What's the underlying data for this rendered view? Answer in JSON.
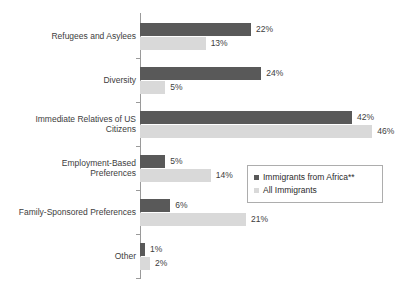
{
  "chart_data": {
    "type": "bar",
    "orientation": "horizontal",
    "title": "",
    "xlabel": "",
    "ylabel": "",
    "xlim": [
      0,
      50
    ],
    "grid": false,
    "legend_position": "middle-right",
    "value_suffix": "%",
    "categories": [
      "Refugees and Asylees",
      "Diversity",
      "Immediate Relatives of US Citizens",
      "Employment-Based Preferences",
      "Family-Sponsored Preferences",
      "Other"
    ],
    "series": [
      {
        "name": "Immigrants from Africa**",
        "color": "#595959",
        "values": [
          22,
          24,
          42,
          5,
          6,
          1
        ],
        "labels": [
          "22%",
          "24%",
          "42%",
          "5%",
          "6%",
          "1%"
        ]
      },
      {
        "name": "All Immigrants",
        "color": "#d9d9d9",
        "values": [
          13,
          5,
          46,
          14,
          21,
          2
        ],
        "labels": [
          "13%",
          "5%",
          "46%",
          "14%",
          "21%",
          "2%"
        ]
      }
    ]
  },
  "axis": {
    "category_labels": [
      "Refugees and Asylees",
      "Diversity",
      "Immediate Relatives of US\nCitizens",
      "Employment-Based\nPreferences",
      "Family-Sponsored Preferences",
      "Other"
    ]
  },
  "legend": {
    "items": [
      {
        "label": "Immigrants from Africa**",
        "swatch": "dark"
      },
      {
        "label": "All Immigrants",
        "swatch": "light"
      }
    ]
  },
  "title_remnant": ""
}
